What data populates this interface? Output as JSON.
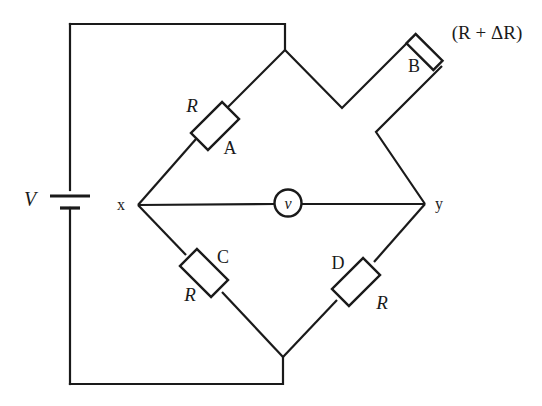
{
  "figure": {
    "type": "wheatstone-bridge-circuit-diagram",
    "background_color": "#ffffff",
    "line_color": "#1a1a1a",
    "text_color": "#1a1a1a"
  },
  "labels": {
    "source": "V",
    "node_left": "x",
    "node_right": "y",
    "meter": "v",
    "arm_a_designator": "A",
    "arm_a_value": "R",
    "arm_b_designator": "B",
    "arm_b_value": "(R + ΔR)",
    "arm_c_designator": "C",
    "arm_c_value": "R",
    "arm_d_designator": "D",
    "arm_d_value": "R"
  },
  "components": [
    {
      "id": "battery",
      "name": "voltage-source",
      "label": "V"
    },
    {
      "id": "resistor-a",
      "name": "resistor-a",
      "designator": "A",
      "value": "R"
    },
    {
      "id": "resistor-b",
      "name": "resistor-b",
      "designator": "B",
      "value": "(R + ΔR)"
    },
    {
      "id": "resistor-c",
      "name": "resistor-c",
      "designator": "C",
      "value": "R"
    },
    {
      "id": "resistor-d",
      "name": "resistor-d",
      "designator": "D",
      "value": "R"
    },
    {
      "id": "voltmeter",
      "name": "voltmeter",
      "label": "v"
    }
  ]
}
